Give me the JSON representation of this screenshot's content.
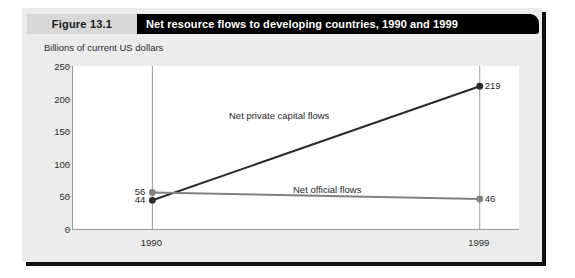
{
  "figure": {
    "number_label": "Figure 13.1",
    "title": "Net resource flows to developing countries, 1990 and 1999"
  },
  "colors": {
    "card_background": "#ececec",
    "plot_background": "#ffffff",
    "banner": "#000000",
    "number_box": "#d8d8d8",
    "axis": "#9a9a9a",
    "gridline": "#9a9a9a",
    "series_private": "#2b2b2b",
    "series_official": "#808080"
  },
  "chart_data": {
    "type": "line",
    "title": "Net resource flows to developing countries, 1990 and 1999",
    "subtitle": "",
    "xlabel": "",
    "ylabel": "Billions of current US dollars",
    "categories": [
      "1990",
      "1999"
    ],
    "x": [
      1990,
      1999
    ],
    "xtick_labels": [
      "1990",
      "1999"
    ],
    "ytick_labels": [
      "0",
      "50",
      "100",
      "150",
      "200",
      "250"
    ],
    "yticks": [
      0,
      50,
      100,
      150,
      200,
      250
    ],
    "ylim": [
      0,
      250
    ],
    "grid": "vertical-only",
    "legend": "inline-series-labels",
    "series": [
      {
        "name": "Net private capital flows",
        "values": [
          44,
          219
        ],
        "point_labels": [
          "44",
          "219"
        ],
        "color": "#2b2b2b",
        "marker": "circle"
      },
      {
        "name": "Net official flows",
        "values": [
          56,
          46
        ],
        "point_labels": [
          "56",
          "46"
        ],
        "color": "#808080",
        "marker": "circle"
      }
    ],
    "annotations": [
      {
        "text": "Net private capital flows",
        "series": "Net private capital flows"
      },
      {
        "text": "Net official flows",
        "series": "Net official flows"
      }
    ]
  }
}
